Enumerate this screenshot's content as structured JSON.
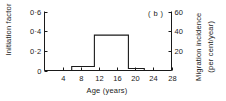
{
  "panel": {
    "label": "( b )"
  },
  "axes": {
    "left": {
      "title": "Initiation factor",
      "ticks": [
        "0",
        "0·2",
        "0·4",
        "0·6"
      ],
      "values": [
        0,
        0.2,
        0.4,
        0.6
      ],
      "min": 0,
      "max": 0.6
    },
    "right": {
      "title_line1": "Migration incidence",
      "title_line2": "(per cent/year)",
      "ticks": [
        "20",
        "40",
        "60"
      ],
      "values": [
        20,
        40,
        60
      ],
      "min": 0,
      "max": 60
    },
    "x": {
      "title": "Age (years)",
      "ticks": [
        "4",
        "8",
        "12",
        "16",
        "20",
        "24",
        "28"
      ],
      "values": [
        4,
        8,
        12,
        16,
        20,
        24,
        28
      ],
      "min": 0,
      "max": 28
    }
  },
  "chart_data": {
    "type": "line",
    "title": "",
    "subtitle": "( b )",
    "xlabel": "Age (years)",
    "ylabel": "Initiation factor",
    "y2label": "Migration incidence (per cent/year)",
    "xlim": [
      0,
      28
    ],
    "ylim": [
      0,
      0.6
    ],
    "y2lim": [
      0,
      60
    ],
    "grid": false,
    "legend": "none",
    "drawstyle": "steps-post",
    "line_color": "#1a1a1a",
    "series": [
      {
        "name": "Initiation factor",
        "x": [
          0,
          6,
          6,
          11,
          11,
          18.5,
          18.5,
          22,
          22,
          28
        ],
        "values": [
          0,
          0,
          0.04,
          0.04,
          0.36,
          0.36,
          0.02,
          0.02,
          0,
          0
        ]
      }
    ],
    "steps": [
      {
        "x_start": 0,
        "x_end": 6,
        "y": 0,
        "y_right": 0
      },
      {
        "x_start": 6,
        "x_end": 11,
        "y": 0.04,
        "y_right": 4
      },
      {
        "x_start": 11,
        "x_end": 18.5,
        "y": 0.36,
        "y_right": 36
      },
      {
        "x_start": 18.5,
        "x_end": 22,
        "y": 0.02,
        "y_right": 2
      },
      {
        "x_start": 22,
        "x_end": 28,
        "y": 0,
        "y_right": 0
      }
    ]
  }
}
